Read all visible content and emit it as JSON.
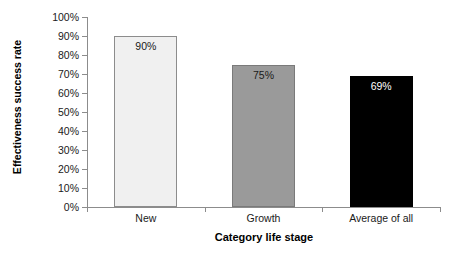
{
  "chart_data": {
    "type": "bar",
    "title": "",
    "xlabel": "Category life stage",
    "ylabel": "Effectiveness success rate",
    "categories": [
      "New",
      "Growth",
      "Average of all"
    ],
    "values": [
      90,
      75,
      69
    ],
    "data_labels": [
      "90%",
      "75%",
      "69%"
    ],
    "ylim": [
      0,
      100
    ],
    "ytick_values": [
      0,
      10,
      20,
      30,
      40,
      50,
      60,
      70,
      80,
      90,
      100
    ],
    "ytick_labels": [
      "0%",
      "10%",
      "20%",
      "30%",
      "40%",
      "50%",
      "60%",
      "70%",
      "80%",
      "90%",
      "100%"
    ],
    "grid": false,
    "legend": false,
    "legend_position": "none",
    "bar_colors": [
      "#f0f0f0",
      "#9a9a9a",
      "#000000"
    ],
    "bar_border_colors": [
      "#8c8c8c",
      "#7a7a7a",
      "#000000"
    ],
    "data_label_colors": [
      "#1a1a1a",
      "#1a1a1a",
      "#ffffff"
    ],
    "axis_color": "#8c8c8c",
    "background_color": "#ffffff"
  }
}
